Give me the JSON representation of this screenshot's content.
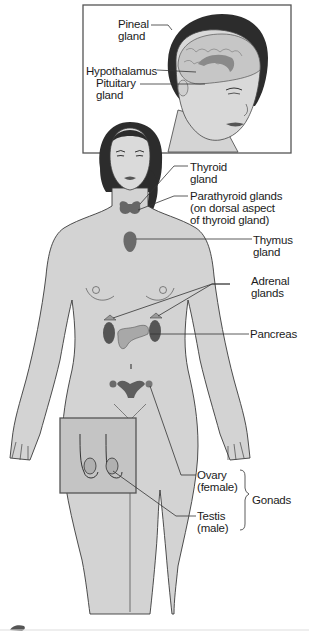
{
  "head_inset": {
    "labels": [
      {
        "id": "pineal",
        "lines": [
          "Pineal",
          "gland"
        ]
      },
      {
        "id": "hypothalamus",
        "lines": [
          "Hypothalamus"
        ]
      },
      {
        "id": "pituitary",
        "lines": [
          "Pituitary",
          "gland"
        ]
      }
    ]
  },
  "body_labels": [
    {
      "id": "thyroid",
      "lines": [
        "Thyroid",
        "gland"
      ]
    },
    {
      "id": "parathyroid",
      "lines": [
        "Parathyroid glands",
        "(on dorsal aspect",
        "of thyroid gland)"
      ]
    },
    {
      "id": "thymus",
      "lines": [
        "Thymus",
        "gland"
      ]
    },
    {
      "id": "adrenal",
      "lines": [
        "Adrenal",
        "glands"
      ]
    },
    {
      "id": "pancreas",
      "lines": [
        "Pancreas"
      ]
    },
    {
      "id": "ovary",
      "lines": [
        "Ovary",
        "(female)"
      ]
    },
    {
      "id": "testis",
      "lines": [
        "Testis",
        "(male)"
      ]
    }
  ],
  "group_label": {
    "id": "gonads",
    "text": "Gonads",
    "members": [
      "ovary",
      "testis"
    ]
  },
  "colors": {
    "skin": "#d6d6d6",
    "skin_shadow": "#bdbdbd",
    "outline": "#3a3a3a",
    "hair": "#2a2a2a",
    "gland": "#6f6f6f",
    "gland_dark": "#555555",
    "leader_line": "#333333",
    "background": "#ffffff"
  }
}
